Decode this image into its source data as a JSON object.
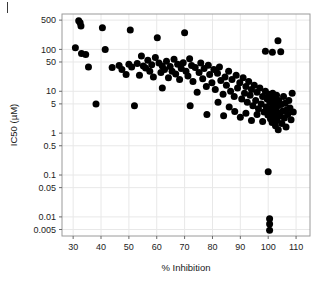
{
  "figure": {
    "panel_label": "",
    "clipped_header_text": "",
    "background_color": "#ffffff",
    "point_color": "#000000",
    "grid_color": "#e8e8e8",
    "panel_border_color": "#9a9a9a"
  },
  "chart_data": {
    "type": "scatter",
    "title": "",
    "xlabel": "% Inhibition",
    "ylabel": "IC50 (µM)",
    "xscale": "linear",
    "yscale": "log",
    "xlim": [
      26,
      115
    ],
    "ylim": [
      0.0035,
      700
    ],
    "xticks": [
      30,
      40,
      50,
      60,
      70,
      80,
      90,
      100,
      110
    ],
    "xticklabels": [
      "30",
      "40",
      "50",
      "60",
      "70",
      "80",
      "90",
      "100",
      "110"
    ],
    "yticks": [
      500,
      100,
      50,
      10,
      5,
      1,
      0.5,
      0.1,
      0.05,
      0.01,
      0.005
    ],
    "yticklabels": [
      "500",
      "100",
      "50",
      "10",
      "5",
      "1",
      "0.5",
      "0.1",
      "0.05",
      "0.01",
      "0.005"
    ],
    "grid": true,
    "legend": null,
    "marker": "filled-circle",
    "marker_size_px": 7,
    "n_points": 148,
    "points": [
      [
        32.0,
        480
      ],
      [
        32.5,
        430
      ],
      [
        32.8,
        360
      ],
      [
        30.8,
        110
      ],
      [
        33.0,
        80
      ],
      [
        34.5,
        75
      ],
      [
        35.5,
        38
      ],
      [
        38.2,
        5.0
      ],
      [
        40.5,
        330
      ],
      [
        41.5,
        100
      ],
      [
        44.0,
        37
      ],
      [
        46.5,
        41
      ],
      [
        47.5,
        33
      ],
      [
        49.0,
        25
      ],
      [
        50.5,
        290
      ],
      [
        50.0,
        44
      ],
      [
        51.0,
        38
      ],
      [
        52.0,
        4.5
      ],
      [
        53.0,
        46
      ],
      [
        53.8,
        24
      ],
      [
        54.5,
        70
      ],
      [
        55.2,
        40
      ],
      [
        56.0,
        36
      ],
      [
        56.8,
        55
      ],
      [
        57.5,
        30
      ],
      [
        58.2,
        43
      ],
      [
        58.8,
        22
      ],
      [
        59.5,
        64
      ],
      [
        60.2,
        190
      ],
      [
        60.8,
        47
      ],
      [
        61.5,
        28
      ],
      [
        62.0,
        40
      ],
      [
        62.8,
        33
      ],
      [
        63.5,
        52
      ],
      [
        64.2,
        21
      ],
      [
        64.8,
        39
      ],
      [
        65.5,
        30
      ],
      [
        66.2,
        58
      ],
      [
        66.8,
        26
      ],
      [
        67.5,
        44
      ],
      [
        68.2,
        19
      ],
      [
        68.8,
        35
      ],
      [
        69.5,
        48
      ],
      [
        70.0,
        250
      ],
      [
        70.5,
        30
      ],
      [
        71.2,
        23
      ],
      [
        71.8,
        60
      ],
      [
        72.5,
        41
      ],
      [
        73.0,
        17
      ],
      [
        73.8,
        37
      ],
      [
        74.5,
        9.5
      ],
      [
        75.2,
        28
      ],
      [
        75.8,
        47
      ],
      [
        76.5,
        20
      ],
      [
        77.0,
        35
      ],
      [
        77.8,
        13
      ],
      [
        78.5,
        42
      ],
      [
        79.0,
        25
      ],
      [
        79.8,
        16
      ],
      [
        80.5,
        33
      ],
      [
        81.0,
        11
      ],
      [
        81.8,
        27
      ],
      [
        82.5,
        38
      ],
      [
        83.0,
        18
      ],
      [
        83.8,
        8.5
      ],
      [
        84.5,
        22
      ],
      [
        85.0,
        14
      ],
      [
        85.8,
        30
      ],
      [
        86.5,
        10
      ],
      [
        87.0,
        19
      ],
      [
        87.8,
        7.5
      ],
      [
        88.5,
        24
      ],
      [
        89.0,
        12
      ],
      [
        89.8,
        16
      ],
      [
        90.5,
        6.5
      ],
      [
        91.0,
        21
      ],
      [
        91.5,
        9.0
      ],
      [
        92.0,
        13
      ],
      [
        92.5,
        5.5
      ],
      [
        93.0,
        17
      ],
      [
        93.5,
        8.0
      ],
      [
        94.0,
        11
      ],
      [
        94.5,
        4.5
      ],
      [
        95.0,
        14
      ],
      [
        95.5,
        6.0
      ],
      [
        96.0,
        9.5
      ],
      [
        96.5,
        3.8
      ],
      [
        97.0,
        12
      ],
      [
        97.5,
        5.0
      ],
      [
        98.0,
        7.5
      ],
      [
        98.5,
        3.2
      ],
      [
        99.0,
        10
      ],
      [
        99.3,
        4.2
      ],
      [
        99.6,
        6.5
      ],
      [
        99.9,
        2.7
      ],
      [
        100.2,
        8.5
      ],
      [
        100.4,
        3.5
      ],
      [
        100.6,
        5.5
      ],
      [
        100.8,
        2.2
      ],
      [
        101.0,
        7.0
      ],
      [
        101.2,
        4.0
      ],
      [
        101.4,
        1.8
      ],
      [
        101.6,
        9.0
      ],
      [
        101.8,
        3.0
      ],
      [
        102.0,
        5.0
      ],
      [
        102.2,
        2.5
      ],
      [
        102.4,
        6.5
      ],
      [
        102.6,
        1.5
      ],
      [
        102.8,
        3.8
      ],
      [
        103.0,
        8.0
      ],
      [
        103.2,
        2.0
      ],
      [
        103.4,
        4.5
      ],
      [
        103.6,
        1.2
      ],
      [
        103.8,
        6.0
      ],
      [
        104.0,
        3.0
      ],
      [
        104.3,
        2.6
      ],
      [
        104.6,
        4.8
      ],
      [
        104.9,
        1.7
      ],
      [
        105.2,
        3.4
      ],
      [
        105.5,
        7.5
      ],
      [
        105.8,
        2.3
      ],
      [
        106.1,
        5.2
      ],
      [
        106.4,
        1.4
      ],
      [
        106.7,
        3.6
      ],
      [
        107.0,
        2.8
      ],
      [
        107.4,
        6.0
      ],
      [
        107.8,
        4.0
      ],
      [
        108.2,
        2.1
      ],
      [
        108.6,
        9.0
      ],
      [
        109.0,
        3.2
      ],
      [
        99.0,
        90
      ],
      [
        101.5,
        85
      ],
      [
        104.5,
        88
      ],
      [
        103.5,
        160
      ],
      [
        84.0,
        2.6
      ],
      [
        86.0,
        4.2
      ],
      [
        88.0,
        3.3
      ],
      [
        90.0,
        2.4
      ],
      [
        92.0,
        3.0
      ],
      [
        94.0,
        2.0
      ],
      [
        96.0,
        2.8
      ],
      [
        98.0,
        1.9
      ],
      [
        100.0,
        0.12
      ],
      [
        100.5,
        0.009
      ],
      [
        100.5,
        0.0068
      ],
      [
        100.5,
        0.0048
      ],
      [
        78.0,
        2.8
      ],
      [
        82.0,
        5.5
      ],
      [
        72.0,
        4.5
      ],
      [
        62.0,
        12
      ]
    ]
  }
}
